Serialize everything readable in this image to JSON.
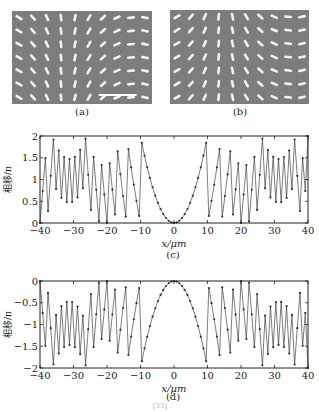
{
  "figure": {
    "panels": [
      {
        "id": "a",
        "label": "(a)",
        "type": "micrograph",
        "rows": 7,
        "cols": 10,
        "has_scale_bar": true
      },
      {
        "id": "b",
        "label": "(b)",
        "type": "micrograph",
        "rows": 7,
        "cols": 10,
        "has_scale_bar": false
      }
    ],
    "caption_partial": "[33]"
  },
  "chart_data": [
    {
      "id": "c",
      "label": "(c)",
      "type": "line",
      "title": "",
      "xlabel": "x/μm",
      "ylabel": "相移/π",
      "xlim": [
        -40,
        40
      ],
      "ylim": [
        0,
        2
      ],
      "xticks": [
        -40,
        -30,
        -20,
        -10,
        0,
        10,
        20,
        30,
        40
      ],
      "yticks": [
        0,
        0.5,
        1,
        1.5,
        2
      ],
      "ytick_labels": [
        "0",
        "0.5",
        "1",
        "1.5",
        "2"
      ],
      "grid": false,
      "markers": true,
      "description": "Wrapped parabolic phase profile, minimum 0 at x=0, rising to 2π near ±10 μm, then wrapping with increasing frequency toward ±40 μm",
      "series": [
        {
          "name": "phase",
          "formula": "mod(2*(x/10)^2, 2)",
          "x_step": 0.8
        }
      ]
    },
    {
      "id": "d",
      "label": "(d)",
      "type": "line",
      "title": "",
      "xlabel": "x/μm",
      "ylabel": "相移/π",
      "xlim": [
        -40,
        40
      ],
      "ylim": [
        -2,
        0
      ],
      "xticks": [
        -40,
        -30,
        -20,
        -10,
        0,
        10,
        20,
        30,
        40
      ],
      "yticks": [
        -2,
        -1.5,
        -1,
        -0.5,
        0
      ],
      "ytick_labels": [
        "−2",
        "−1.5",
        "−1",
        "−0.5",
        "0"
      ],
      "grid": false,
      "markers": true,
      "description": "Wrapped negative parabolic phase profile, maximum 0 at x=0, falling to −2π near ±10 μm, then wrapping with increasing frequency",
      "series": [
        {
          "name": "phase",
          "formula": "-mod(2*(x/10)^2, 2)",
          "x_step": 0.8
        }
      ]
    }
  ]
}
